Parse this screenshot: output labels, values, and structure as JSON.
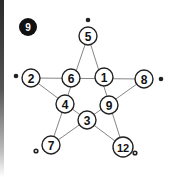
{
  "puzzle": {
    "number_badge": "9",
    "nodes": [
      {
        "id": "top",
        "label": "5"
      },
      {
        "id": "inner-left",
        "label": "6"
      },
      {
        "id": "inner-right",
        "label": "1"
      },
      {
        "id": "left",
        "label": "2"
      },
      {
        "id": "right",
        "label": "8"
      },
      {
        "id": "inner-bottom-left",
        "label": "4"
      },
      {
        "id": "inner-bottom-right",
        "label": "9"
      },
      {
        "id": "inner-bottom",
        "label": "3"
      },
      {
        "id": "bottom-left",
        "label": "7"
      },
      {
        "id": "bottom-right",
        "label": "12"
      }
    ],
    "colors": {
      "line": "#777777",
      "stroke": "#222222",
      "badge": "#111111"
    }
  }
}
